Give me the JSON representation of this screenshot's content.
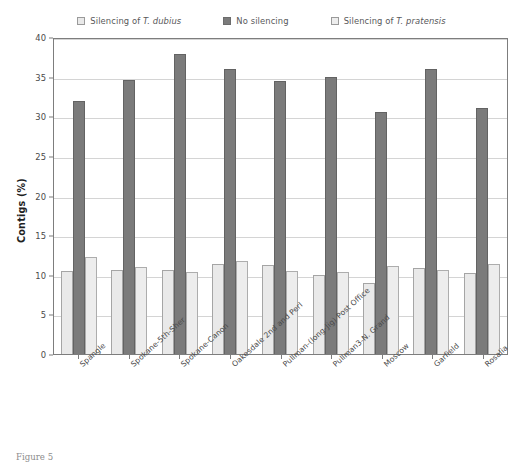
{
  "caption": "Figure 5",
  "chart_data": {
    "type": "bar",
    "title": "",
    "xlabel": "",
    "ylabel": "Contigs (%)",
    "ylim": [
      0,
      40
    ],
    "yticks": [
      0,
      5,
      10,
      15,
      20,
      25,
      30,
      35,
      40
    ],
    "grid": true,
    "legend_position": "top-center",
    "categories": [
      "Spangle",
      "Spokane-5th-Sher",
      "Spokane-Canon",
      "Oakesdale 2nd and Perl",
      "Pullman-(long-Jig) Post Office",
      "Pullman3-N. Grand",
      "Moscow",
      "Garfield",
      "Rosalia"
    ],
    "series": [
      {
        "name": "Silencing of T. dubius",
        "name_plain": "Silencing of ",
        "name_italic": "T. dubius",
        "color": "#e9e9e9",
        "border": "#a5a5a5",
        "values": [
          10.5,
          10.6,
          10.6,
          11.3,
          11.2,
          10.0,
          9.0,
          10.9,
          10.2
        ]
      },
      {
        "name": "No silencing",
        "name_plain": "No silencing",
        "name_italic": "",
        "color": "#7b7b7b",
        "border": "#636363",
        "values": [
          31.9,
          34.6,
          37.9,
          36.0,
          34.5,
          35.0,
          30.6,
          36.0,
          31.0
        ]
      },
      {
        "name": "Silencing of T. pratensis",
        "name_plain": "Silencing of ",
        "name_italic": "T. pratensis",
        "color": "#ededed",
        "border": "#adadad",
        "values": [
          12.3,
          11.0,
          10.4,
          11.8,
          10.5,
          10.4,
          11.1,
          10.6,
          11.3
        ]
      }
    ]
  }
}
